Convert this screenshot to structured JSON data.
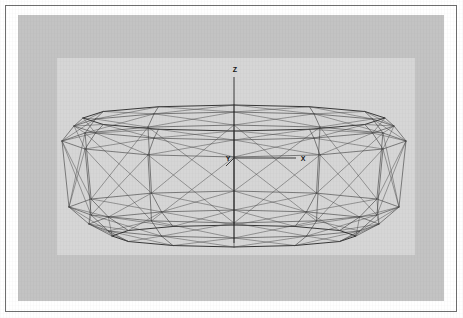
{
  "figure": {
    "kind": "3d-wireframe-mesh",
    "colors": {
      "page_background": "#ffffff",
      "plate_border": "#6e6e6e",
      "backdrop_panel": "#c3c3c3",
      "drawing_panel": "#d6d6d6",
      "mesh_stroke": "#3a3a3a",
      "rim_stroke": "#262626",
      "axis_stroke": "#2b2b2b",
      "label_text": "#141414"
    }
  },
  "axes": {
    "origin": {
      "x": 234,
      "y": 158
    },
    "z": {
      "label": "Z",
      "label_x": 235,
      "label_y": 72,
      "from": {
        "x": 234,
        "y": 77
      },
      "to": {
        "x": 234,
        "y": 243
      }
    },
    "x": {
      "label": "X",
      "label_x": 303,
      "label_y": 161,
      "from": {
        "x": 234,
        "y": 158
      },
      "to": {
        "x": 296,
        "y": 158
      }
    },
    "y": {
      "label": "Y",
      "label_x": 228,
      "label_y": 161,
      "from": {
        "x": 234,
        "y": 158
      },
      "to": {
        "x": 226,
        "y": 166
      }
    }
  },
  "chart_data": {
    "type": "scatter",
    "title": "",
    "xlabel": "X",
    "ylabel": "Y",
    "zlabel": "Z",
    "grid": false,
    "legend": null,
    "rings": [
      {
        "name": "top-rim",
        "cy": 118,
        "rx": 151,
        "ry": 13,
        "sides": 12
      },
      {
        "name": "upper-shoulder",
        "cy": 126,
        "rx": 160,
        "ry": 14,
        "sides": 12
      },
      {
        "name": "equator-upper",
        "cy": 141,
        "rx": 172,
        "ry": 16,
        "sides": 12
      },
      {
        "name": "equator-lower",
        "cy": 207,
        "rx": 165,
        "ry": 16,
        "sides": 12
      },
      {
        "name": "lower-shoulder",
        "cy": 224,
        "rx": 145,
        "ry": 14,
        "sides": 12
      },
      {
        "name": "bottom-rim",
        "cy": 236,
        "rx": 122,
        "ry": 11,
        "sides": 12
      }
    ],
    "center_x": 234
  }
}
